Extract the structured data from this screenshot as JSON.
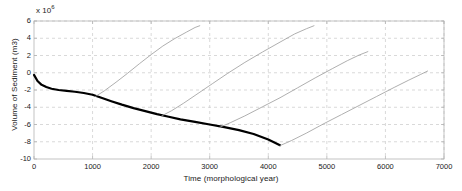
{
  "chart_data": {
    "type": "line",
    "title": "",
    "xlabel": "Time (morphological year)",
    "ylabel": "Volume of Sediment (m3)",
    "y_exponent_label": "x 10",
    "y_exponent_value": "6",
    "xlim": [
      0,
      7000
    ],
    "ylim": [
      -10,
      6
    ],
    "xticks": [
      0,
      1000,
      2000,
      3000,
      4000,
      5000,
      6000,
      7000
    ],
    "yticks": [
      -10,
      -8,
      -6,
      -4,
      -2,
      0,
      2,
      4,
      6
    ],
    "xtick_labels": [
      "0",
      "1000",
      "2000",
      "3000",
      "4000",
      "5000",
      "6000",
      "7000"
    ],
    "ytick_labels": [
      "-10",
      "-8",
      "-6",
      "-4",
      "-2",
      "0",
      "2",
      "4",
      "6"
    ],
    "grid": true,
    "grid_style": "dashed",
    "grid_color": "#c8c8c8",
    "legend": "none",
    "background_color": "#ffffff",
    "axis_color": "#b4b4b4",
    "series": [
      {
        "name": "baseline-erosion",
        "style": "thick-black",
        "color": "#000000",
        "width": 2.2,
        "x": [
          0,
          60,
          130,
          210,
          300,
          420,
          560,
          700,
          850,
          1000,
          1150,
          1320,
          1500,
          1700,
          1900,
          2100,
          2300,
          2500,
          2750,
          3000,
          3250,
          3500,
          3750,
          4000,
          4200
        ],
        "y": [
          -0.25,
          -0.95,
          -1.4,
          -1.65,
          -1.85,
          -2.0,
          -2.1,
          -2.2,
          -2.35,
          -2.55,
          -2.9,
          -3.3,
          -3.7,
          -4.1,
          -4.45,
          -4.8,
          -5.1,
          -5.4,
          -5.7,
          -6.0,
          -6.3,
          -6.65,
          -7.1,
          -7.75,
          -8.4
        ]
      },
      {
        "name": "recovery-curve-1",
        "style": "thin-gray",
        "color": "#9a9a9a",
        "width": 0.8,
        "x": [
          1050,
          1200,
          1400,
          1600,
          1800,
          2000,
          2200,
          2400,
          2600,
          2750,
          2830
        ],
        "y": [
          -2.75,
          -2.1,
          -1.1,
          -0.05,
          1.05,
          2.1,
          3.1,
          3.95,
          4.7,
          5.25,
          5.45
        ]
      },
      {
        "name": "recovery-curve-2",
        "style": "thin-gray",
        "color": "#9a9a9a",
        "width": 0.8,
        "x": [
          2180,
          2350,
          2550,
          2800,
          3050,
          3300,
          3600,
          3900,
          4200,
          4450,
          4650,
          4780
        ],
        "y": [
          -5.0,
          -4.4,
          -3.55,
          -2.4,
          -1.25,
          -0.1,
          1.2,
          2.4,
          3.55,
          4.5,
          5.1,
          5.45
        ]
      },
      {
        "name": "recovery-curve-3",
        "style": "thin-gray",
        "color": "#9a9a9a",
        "width": 0.8,
        "x": [
          3160,
          3350,
          3600,
          3900,
          4200,
          4500,
          4800,
          5100,
          5350,
          5550,
          5700
        ],
        "y": [
          -6.35,
          -5.8,
          -5.0,
          -3.95,
          -2.9,
          -1.75,
          -0.6,
          0.5,
          1.4,
          2.05,
          2.45
        ]
      },
      {
        "name": "recovery-curve-4",
        "style": "thin-gray",
        "color": "#9a9a9a",
        "width": 0.8,
        "x": [
          4200,
          4400,
          4650,
          4950,
          5250,
          5550,
          5850,
          6150,
          6400,
          6600,
          6720
        ],
        "y": [
          -8.45,
          -7.85,
          -7.0,
          -5.9,
          -4.85,
          -3.8,
          -2.75,
          -1.7,
          -0.85,
          -0.2,
          0.2
        ]
      }
    ]
  }
}
